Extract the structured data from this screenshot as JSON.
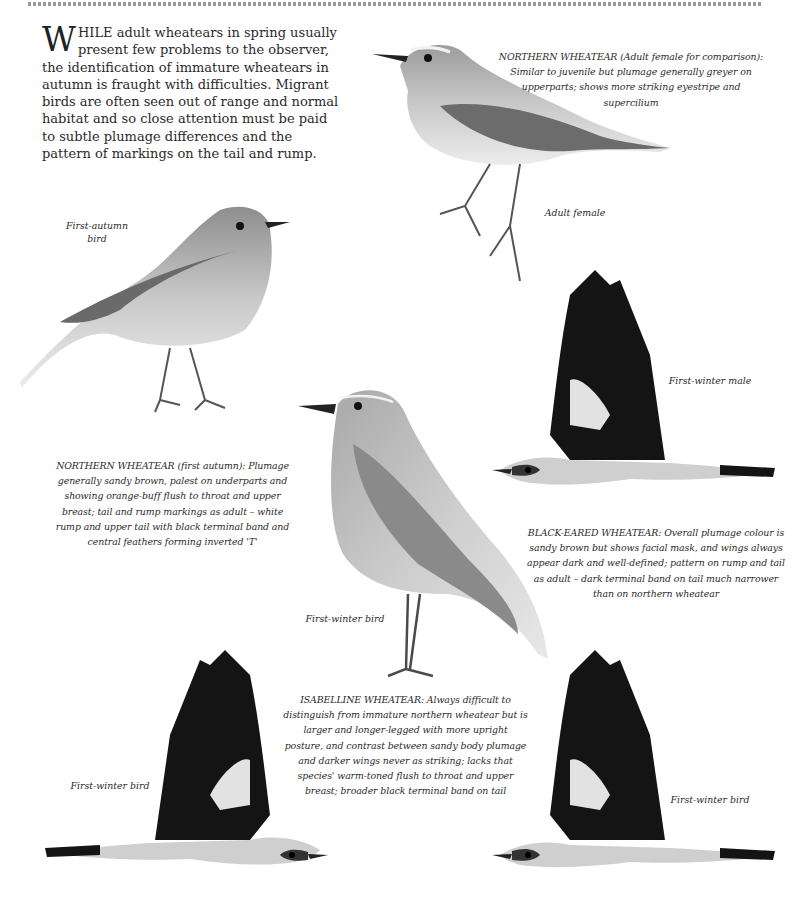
{
  "intro": {
    "drop_cap": "W",
    "small_caps": "HILE",
    "text": " adult wheatears in spring usually present few problems to the observer, the identification of immature wheatears in autumn is fraught with difficulties. Migrant birds are often seen out of range and normal habitat and so close attention must be paid to subtle plumage differences and the pattern of markings on the tail and rump."
  },
  "captions": {
    "northern_adult_female": "NORTHERN WHEATEAR (Adult female for comparison): Similar to juvenile but plumage generally greyer on upperparts; shows more striking eyestripe and supercilium",
    "northern_first_autumn": "NORTHERN WHEATEAR (first autumn): Plumage generally sandy brown, palest on underparts and showing orange-buff flush to throat and upper breast; tail and rump markings as adult – white rump and upper tail with black terminal band and central feathers forming inverted 'T'",
    "black_eared": "BLACK-EARED WHEATEAR: Overall plumage colour is sandy brown but shows facial mask, and wings always appear dark and well-defined; pattern on rump and tail as adult – dark terminal band on tail much narrower than on northern wheatear",
    "isabelline": "ISABELLINE WHEATEAR: Always difficult to distinguish from immature northern wheatear but is larger and longer-legged with more upright posture, and contrast between sandy body plumage and darker wings never as striking; lacks that species' warm-toned flush to throat and upper breast; broader black terminal band on tail"
  },
  "labels": {
    "first_autumn_bird": "First-autumn bird",
    "adult_female": "Adult female",
    "first_winter_male": "First-winter male",
    "first_winter_bird_center": "First-winter bird",
    "first_winter_bird_left": "First-winter bird",
    "first_winter_bird_right": "First-winter bird"
  },
  "colors": {
    "ink": "#222222",
    "wing_dark": "#141414",
    "body_light": "#d8d8d8",
    "body_mid": "#a5a5a5",
    "rule": "#9a9a9a"
  }
}
